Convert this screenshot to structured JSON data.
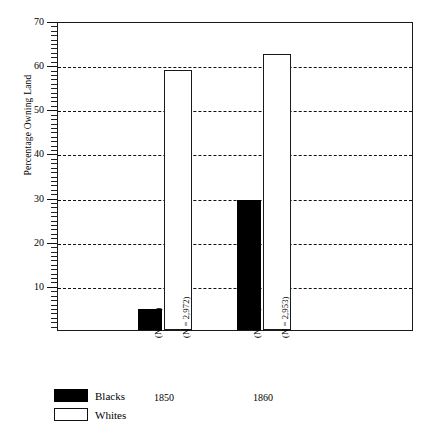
{
  "chart_data": {
    "type": "bar",
    "title": "",
    "xlabel": "",
    "ylabel": "Percentage Owning Land",
    "ylim": [
      0,
      70
    ],
    "ytick_labels": [
      "10",
      "20",
      "30",
      "40",
      "50",
      "60",
      "70"
    ],
    "ytick_values": [
      10,
      20,
      30,
      40,
      50,
      60,
      70
    ],
    "grid": true,
    "legend_position": "below-left",
    "categories": [
      "1850",
      "1860"
    ],
    "series": [
      {
        "name": "Blacks",
        "values": [
          4.7,
          29.5
        ],
        "color": "#000000",
        "fill": "solid"
      },
      {
        "name": "Whites",
        "values": [
          59.0,
          62.5
        ],
        "color": "#ffffff",
        "fill": "outline"
      }
    ],
    "annotations": [
      {
        "text": "(N = 62)",
        "group": "1850",
        "series": "Blacks"
      },
      {
        "text": "(N = 2,972)",
        "group": "1850",
        "series": "Whites"
      },
      {
        "text": "(N = 37)",
        "group": "1860",
        "series": "Blacks"
      },
      {
        "text": "(N = 2,953)",
        "group": "1860",
        "series": "Whites"
      }
    ]
  },
  "axis": {
    "y_title": "Percentage Owning Land",
    "ticks": [
      {
        "label": "70",
        "value": 70
      },
      {
        "label": "60",
        "value": 60
      },
      {
        "label": "50",
        "value": 50
      },
      {
        "label": "40",
        "value": 40
      },
      {
        "label": "30",
        "value": 30
      },
      {
        "label": "20",
        "value": 20
      },
      {
        "label": "10",
        "value": 10
      }
    ]
  },
  "groups": [
    {
      "year": "1850",
      "bars": [
        {
          "series": "Blacks",
          "value": 4.7,
          "n_label": "(N = 62)"
        },
        {
          "series": "Whites",
          "value": 59.0,
          "n_label": "(N = 2,972)"
        }
      ]
    },
    {
      "year": "1860",
      "bars": [
        {
          "series": "Blacks",
          "value": 29.5,
          "n_label": "(N = 37)"
        },
        {
          "series": "Whites",
          "value": 62.5,
          "n_label": "(N = 2,953)"
        }
      ]
    }
  ],
  "legend": {
    "items": [
      {
        "label": "Blacks",
        "style": "filled"
      },
      {
        "label": "Whites",
        "style": "outline"
      }
    ]
  }
}
